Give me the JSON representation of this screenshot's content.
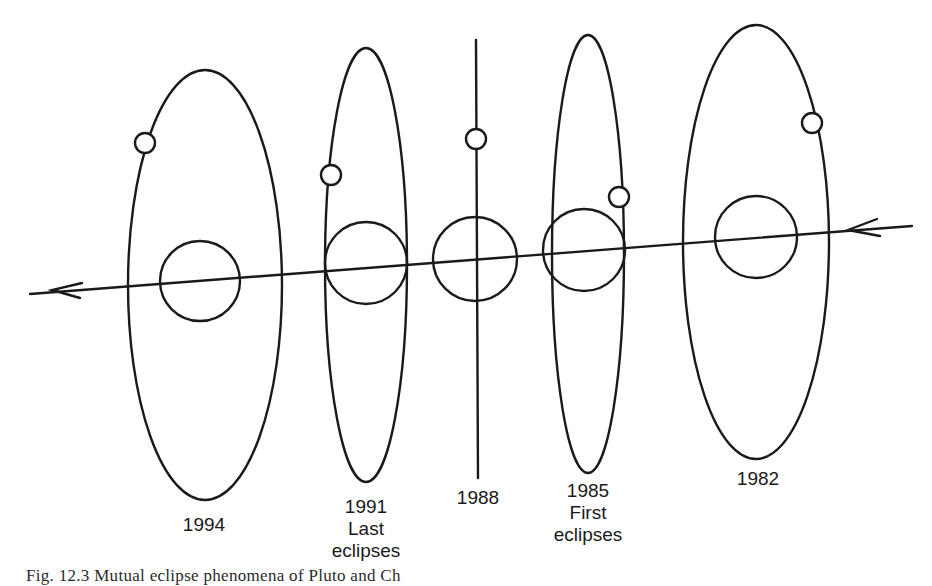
{
  "figure": {
    "stroke_color": "#1a1a1a",
    "background": "#ffffff",
    "orbits": [
      {
        "id": "1994",
        "year": "1994",
        "note_line1": "",
        "note_line2": "",
        "orbit_shape": "ellipse",
        "label_x": 204,
        "label_y": 497
      },
      {
        "id": "1991",
        "year": "1991",
        "note_line1": "Last",
        "note_line2": "eclipses",
        "orbit_shape": "ellipse",
        "label_x": 366,
        "label_y": 497
      },
      {
        "id": "1988",
        "year": "1988",
        "note_line1": "",
        "note_line2": "",
        "orbit_shape": "edge-on line",
        "label_x": 478,
        "label_y": 488
      },
      {
        "id": "1985",
        "year": "1985",
        "note_line1": "First",
        "note_line2": "eclipses",
        "orbit_shape": "ellipse",
        "label_x": 588,
        "label_y": 480
      },
      {
        "id": "1982",
        "year": "1982",
        "note_line1": "",
        "note_line2": "",
        "orbit_shape": "ellipse",
        "label_x": 758,
        "label_y": 468
      }
    ],
    "motion_direction": "right-to-left",
    "caption": "Fig. 12.3  Mutual eclipse phenomena of Pluto and Ch"
  }
}
